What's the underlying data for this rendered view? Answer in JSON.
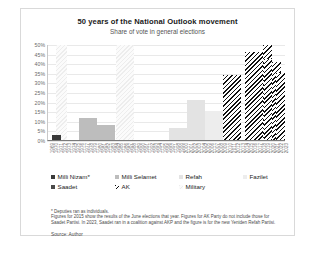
{
  "header": {
    "title": "50 years of the National Outlook movement",
    "subtitle": "Share of vote in general elections"
  },
  "legend": {
    "row1": [
      {
        "key": "nizam",
        "label": "Milli Nizam*",
        "swatch": "sw-nizam"
      },
      {
        "key": "selamet",
        "label": "Milli Selamet",
        "swatch": "sw-selamet"
      },
      {
        "key": "refah",
        "label": "Refah",
        "swatch": "sw-refah"
      },
      {
        "key": "fazilet",
        "label": "Fazilet",
        "swatch": "sw-fazilet"
      }
    ],
    "row2": [
      {
        "key": "saadet",
        "label": "Saadet",
        "swatch": "sw-saadet"
      },
      {
        "key": "ak",
        "label": "AK",
        "swatch": "sw-ak"
      },
      {
        "key": "military",
        "label": "Military",
        "swatch": "sw-military"
      }
    ]
  },
  "notes": {
    "line1": "* Deputies ran as individuals.",
    "line2": "Figures for 2015 show the results of the June elections that year. Figures for AK Party do not include those for Saadet Partisi. In 2023, Saadet ran in a coalition against AKP and the figure is for the new Yeniden Refah Partisi.",
    "source": "Source: Author"
  },
  "chart_data": {
    "type": "bar",
    "title": "50 years of the National Outlook movement",
    "subtitle": "Share of vote in general elections",
    "xlabel": "",
    "ylabel": "",
    "ylim": [
      0,
      50
    ],
    "ytick_labels": [
      "0%",
      "5%",
      "10%",
      "15%",
      "20%",
      "25%",
      "30%",
      "35%",
      "40%",
      "45%",
      "50%"
    ],
    "ytick_values": [
      0,
      5,
      10,
      15,
      20,
      25,
      30,
      35,
      40,
      45,
      50
    ],
    "grid": true,
    "legend_position": "below",
    "categories": [
      "1969",
      "1970",
      "1971",
      "1972",
      "1973",
      "1974",
      "1975",
      "1976",
      "1977",
      "1978",
      "1979",
      "1980",
      "1981",
      "1982",
      "1983",
      "1984",
      "1985",
      "1986",
      "1987",
      "1988",
      "1989",
      "1990",
      "1991",
      "1992",
      "1993",
      "1994",
      "1995",
      "1996",
      "1997",
      "1998",
      "1999",
      "2000",
      "2001",
      "2002",
      "2003",
      "2004",
      "2005",
      "2006",
      "2007",
      "2008",
      "2009",
      "2010",
      "2011",
      "2012",
      "2013",
      "2014",
      "2015",
      "2016",
      "2017",
      "2018",
      "2019",
      "2020",
      "2021",
      "2022",
      "2023"
    ],
    "bars": [
      {
        "year": "1969",
        "value": 3.0,
        "party": "Milli Nizam*"
      },
      {
        "year": "1973",
        "value": 11.8,
        "party": "Milli Selamet"
      },
      {
        "year": "1977",
        "value": 8.6,
        "party": "Milli Selamet"
      },
      {
        "year": "1991",
        "value": 6.7,
        "party": "Refah"
      },
      {
        "year": "1995",
        "value": 21.4,
        "party": "Refah"
      },
      {
        "year": "1999",
        "value": 15.4,
        "party": "Fazilet"
      },
      {
        "year": "2002",
        "value": 2.5,
        "party": "Saadet"
      },
      {
        "year": "2002",
        "value": 34.3,
        "party": "AK"
      },
      {
        "year": "2007",
        "value": 46.6,
        "party": "AK"
      },
      {
        "year": "2011",
        "value": 49.8,
        "party": "AK"
      },
      {
        "year": "2015",
        "value": 40.9,
        "party": "AK"
      },
      {
        "year": "2018",
        "value": 42.6,
        "party": "AK"
      },
      {
        "year": "2023",
        "value": 35.6,
        "party": "AK"
      }
    ],
    "military_bands": [
      {
        "from": "1971",
        "to": "1972",
        "label": "Military"
      },
      {
        "from": "1980",
        "to": "1982",
        "label": "Military"
      }
    ]
  },
  "plot_geometry": {
    "bars": [
      {
        "name": "nizam-1969",
        "left": 2.1,
        "width": 3.6,
        "height": 6.0,
        "cls": "sw-nizam"
      },
      {
        "name": "selamet-1973",
        "left": 13.4,
        "width": 7.6,
        "height": 23.6,
        "cls": "sw-selamet"
      },
      {
        "name": "selamet-1977",
        "left": 21.0,
        "width": 7.6,
        "height": 17.2,
        "cls": "sw-selamet"
      },
      {
        "name": "refah-1991",
        "left": 51.3,
        "width": 7.6,
        "height": 13.4,
        "cls": "sw-refah"
      },
      {
        "name": "refah-1995",
        "left": 58.9,
        "width": 7.6,
        "height": 42.8,
        "cls": "sw-refah"
      },
      {
        "name": "fazilet-1999",
        "left": 66.5,
        "width": 7.6,
        "height": 30.8,
        "cls": "sw-fazilet"
      },
      {
        "name": "saadet-2002",
        "left": 74.1,
        "width": 3.2,
        "height": 5.0,
        "cls": "sw-saadet"
      },
      {
        "name": "ak-2002",
        "left": 74.1,
        "width": 7.6,
        "height": 68.6,
        "cls": "sw-ak"
      },
      {
        "name": "ak-2007",
        "left": 83.0,
        "width": 7.6,
        "height": 93.2,
        "cls": "sw-ak"
      },
      {
        "name": "ak-2011",
        "left": 90.6,
        "width": 3.8,
        "height": 99.6,
        "cls": "sw-ak"
      },
      {
        "name": "ak-2015",
        "left": 94.4,
        "width": 3.8,
        "height": 81.8,
        "cls": "sw-ak"
      },
      {
        "name": "ak-2018",
        "left": 91.0,
        "width": 3.4,
        "height": 85.2,
        "cls": "sw-ak"
      },
      {
        "name": "ak-2023",
        "left": 96.4,
        "width": 3.6,
        "height": 71.2,
        "cls": "sw-ak"
      }
    ],
    "bands": [
      {
        "name": "military-1971",
        "left": 3.6,
        "width": 5.0
      },
      {
        "name": "military-1980",
        "left": 28.9,
        "width": 7.7
      }
    ]
  }
}
